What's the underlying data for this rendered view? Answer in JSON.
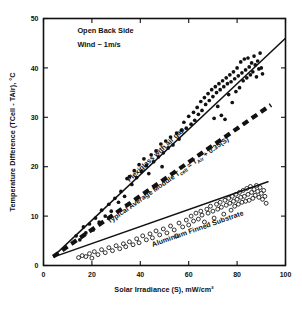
{
  "chart_data": {
    "type": "scatter",
    "title": "",
    "xlabel": "Solar Irradiance (S), mW/cm²",
    "ylabel": "Temperature Difference (TCell - TAir), °C",
    "xlim": [
      0,
      100
    ],
    "ylim": [
      0,
      50
    ],
    "xticks": [
      0,
      20,
      40,
      60,
      80,
      100
    ],
    "yticks": [
      0,
      10,
      20,
      30,
      40,
      50
    ],
    "grid": false,
    "legend_position": "inline-annotations",
    "annotations": [
      {
        "name": "condition-line-1",
        "text": "Open Back Side",
        "x": 14,
        "y": 47
      },
      {
        "name": "condition-line-2",
        "text": "Wind ~ 1m/s",
        "x": 14,
        "y": 44.2
      }
    ],
    "series": [
      {
        "name": "Plexiglass with air gap",
        "label": "Plexiglass with air gap",
        "marker": "filled-circle",
        "fit_line": {
          "style": "solid",
          "x": [
            4,
            100
          ],
          "y": [
            1.8,
            46.0
          ],
          "slope": 0.46,
          "intercept": -0.04
        },
        "points": [
          [
            13.5,
            6.0
          ],
          [
            15.0,
            5.2
          ],
          [
            16.5,
            7.8
          ],
          [
            17.5,
            6.6
          ],
          [
            19.0,
            8.4
          ],
          [
            20.5,
            7.2
          ],
          [
            21.5,
            9.6
          ],
          [
            23.0,
            8.8
          ],
          [
            24.0,
            11.2
          ],
          [
            25.5,
            10.0
          ],
          [
            27.0,
            12.4
          ],
          [
            28.0,
            11.0
          ],
          [
            29.5,
            13.6
          ],
          [
            31.0,
            12.8
          ],
          [
            32.0,
            15.0
          ],
          [
            33.5,
            14.0
          ],
          [
            34.5,
            17.6
          ],
          [
            35.5,
            18.0
          ],
          [
            36.5,
            16.4
          ],
          [
            37.5,
            19.2
          ],
          [
            38.5,
            17.8
          ],
          [
            39.5,
            20.4
          ],
          [
            40.5,
            19.0
          ],
          [
            41.5,
            21.6
          ],
          [
            42.5,
            20.2
          ],
          [
            43.5,
            18.6
          ],
          [
            44.5,
            22.4
          ],
          [
            45.5,
            21.0
          ],
          [
            46.5,
            23.2
          ],
          [
            47.5,
            22.0
          ],
          [
            48.5,
            24.6
          ],
          [
            49.0,
            20.0
          ],
          [
            49.5,
            22.8
          ],
          [
            50.5,
            25.2
          ],
          [
            51.5,
            23.8
          ],
          [
            52.5,
            26.0
          ],
          [
            53.5,
            24.4
          ],
          [
            55.0,
            26.8
          ],
          [
            56.0,
            25.6
          ],
          [
            57.0,
            27.4
          ],
          [
            58.0,
            29.0
          ],
          [
            59.0,
            27.8
          ],
          [
            60.0,
            30.2
          ],
          [
            61.0,
            28.6
          ],
          [
            62.0,
            31.0
          ],
          [
            62.5,
            29.4
          ],
          [
            63.5,
            32.0
          ],
          [
            64.0,
            30.6
          ],
          [
            65.0,
            33.2
          ],
          [
            65.5,
            31.4
          ],
          [
            66.5,
            34.0
          ],
          [
            67.0,
            32.6
          ],
          [
            68.0,
            34.8
          ],
          [
            68.5,
            33.4
          ],
          [
            69.5,
            35.6
          ],
          [
            70.0,
            34.2
          ],
          [
            70.5,
            29.8
          ],
          [
            71.0,
            36.2
          ],
          [
            71.5,
            35.0
          ],
          [
            72.0,
            32.2
          ],
          [
            72.5,
            36.8
          ],
          [
            73.0,
            35.6
          ],
          [
            73.5,
            30.4
          ],
          [
            74.0,
            37.4
          ],
          [
            74.5,
            36.2
          ],
          [
            75.0,
            29.6
          ],
          [
            75.5,
            38.0
          ],
          [
            76.0,
            36.8
          ],
          [
            76.5,
            34.6
          ],
          [
            77.0,
            38.6
          ],
          [
            77.5,
            37.2
          ],
          [
            78.0,
            33.0
          ],
          [
            78.5,
            39.2
          ],
          [
            79.0,
            37.8
          ],
          [
            79.5,
            35.2
          ],
          [
            80.0,
            40.0
          ],
          [
            80.5,
            38.4
          ],
          [
            81.0,
            36.0
          ],
          [
            81.5,
            41.2
          ],
          [
            82.0,
            39.0
          ],
          [
            82.5,
            37.4
          ],
          [
            83.0,
            41.8
          ],
          [
            83.5,
            39.6
          ],
          [
            84.0,
            38.0
          ],
          [
            84.5,
            42.0
          ],
          [
            85.0,
            40.2
          ],
          [
            85.5,
            38.6
          ],
          [
            86.0,
            41.0
          ],
          [
            86.5,
            39.2
          ],
          [
            87.0,
            42.4
          ],
          [
            87.5,
            40.6
          ],
          [
            88.0,
            38.2
          ],
          [
            88.5,
            41.4
          ],
          [
            89.0,
            39.8
          ],
          [
            89.5,
            43.0
          ],
          [
            90.0,
            40.0
          ],
          [
            90.5,
            38.8
          ]
        ]
      },
      {
        "name": "Typical Average Module",
        "label": "Typical Average Module Tₑₗₗ = Tₐᵢᵣ + 0.35(S)",
        "label_plain": "Typical Average Module Tcell = TAir + 0.35(S)",
        "marker": "none",
        "fit_line": {
          "style": "dashed",
          "x": [
            4,
            94
          ],
          "y": [
            1.8,
            32.5
          ],
          "slope": 0.35,
          "intercept": 0.4
        },
        "points": []
      },
      {
        "name": "Aluminium Finned Substrate",
        "label": "Aluminium Finned Substrate",
        "marker": "open-circle",
        "fit_line": {
          "style": "solid",
          "x": [
            4,
            93
          ],
          "y": [
            1.7,
            17.0
          ],
          "slope": 0.172,
          "intercept": 1.0
        },
        "points": [
          [
            14.5,
            1.6
          ],
          [
            16.0,
            2.0
          ],
          [
            17.5,
            1.8
          ],
          [
            19.0,
            2.4
          ],
          [
            20.0,
            1.5
          ],
          [
            21.0,
            2.8
          ],
          [
            22.5,
            2.2
          ],
          [
            24.0,
            3.2
          ],
          [
            25.5,
            2.6
          ],
          [
            27.0,
            3.6
          ],
          [
            28.5,
            3.0
          ],
          [
            30.0,
            4.0
          ],
          [
            31.5,
            3.4
          ],
          [
            33.0,
            4.4
          ],
          [
            34.0,
            3.8
          ],
          [
            35.5,
            4.8
          ],
          [
            37.0,
            4.2
          ],
          [
            38.5,
            5.4
          ],
          [
            39.5,
            4.6
          ],
          [
            41.0,
            6.0
          ],
          [
            42.5,
            5.2
          ],
          [
            44.0,
            6.4
          ],
          [
            45.0,
            5.6
          ],
          [
            46.5,
            7.0
          ],
          [
            48.0,
            6.2
          ],
          [
            49.5,
            7.4
          ],
          [
            51.0,
            6.6
          ],
          [
            52.5,
            8.0
          ],
          [
            54.0,
            7.2
          ],
          [
            55.0,
            6.0
          ],
          [
            56.0,
            8.6
          ],
          [
            57.5,
            7.8
          ],
          [
            59.0,
            9.2
          ],
          [
            60.0,
            8.2
          ],
          [
            61.0,
            10.0
          ],
          [
            62.0,
            9.0
          ],
          [
            63.0,
            10.6
          ],
          [
            64.0,
            9.4
          ],
          [
            65.0,
            11.0
          ],
          [
            65.5,
            10.2
          ],
          [
            66.5,
            8.8
          ],
          [
            67.5,
            11.4
          ],
          [
            68.0,
            10.6
          ],
          [
            69.0,
            12.0
          ],
          [
            70.0,
            11.0
          ],
          [
            70.5,
            9.6
          ],
          [
            71.5,
            12.4
          ],
          [
            72.0,
            11.4
          ],
          [
            73.0,
            12.8
          ],
          [
            73.5,
            11.8
          ],
          [
            74.5,
            10.4
          ],
          [
            75.0,
            13.2
          ],
          [
            75.5,
            12.2
          ],
          [
            76.5,
            13.6
          ],
          [
            77.0,
            12.6
          ],
          [
            77.5,
            11.2
          ],
          [
            78.0,
            14.0
          ],
          [
            78.5,
            13.0
          ],
          [
            79.0,
            12.0
          ],
          [
            79.5,
            14.4
          ],
          [
            80.0,
            13.4
          ],
          [
            80.5,
            12.4
          ],
          [
            81.0,
            14.8
          ],
          [
            81.5,
            13.8
          ],
          [
            82.0,
            12.8
          ],
          [
            82.5,
            15.2
          ],
          [
            83.0,
            14.0
          ],
          [
            83.5,
            13.0
          ],
          [
            84.0,
            15.6
          ],
          [
            84.5,
            14.4
          ],
          [
            85.0,
            13.2
          ],
          [
            85.5,
            16.0
          ],
          [
            86.0,
            14.8
          ],
          [
            86.5,
            13.6
          ],
          [
            87.0,
            15.4
          ],
          [
            87.5,
            14.2
          ],
          [
            88.0,
            16.2
          ],
          [
            88.5,
            15.0
          ],
          [
            89.0,
            13.8
          ],
          [
            89.5,
            15.8
          ],
          [
            90.0,
            14.6
          ],
          [
            90.5,
            13.4
          ],
          [
            91.0,
            15.2
          ],
          [
            91.5,
            14.0
          ],
          [
            92.0,
            12.6
          ]
        ]
      }
    ]
  }
}
